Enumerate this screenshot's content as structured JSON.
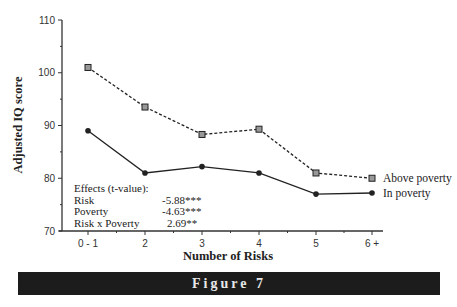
{
  "chart_data": {
    "type": "line",
    "title": "",
    "xlabel": "Number of Risks",
    "ylabel": "Adjusted IQ score",
    "categories": [
      "0 - 1",
      "2",
      "3",
      "4",
      "5",
      "6 +"
    ],
    "ylim": [
      70,
      110
    ],
    "yticks": [
      70,
      80,
      90,
      100,
      110
    ],
    "grid": false,
    "legend_position": "inline-right",
    "series": [
      {
        "name": "Above poverty",
        "style": "dashed",
        "marker": "square",
        "values": [
          101,
          93.5,
          88.3,
          89.3,
          81,
          80
        ]
      },
      {
        "name": "In poverty",
        "style": "solid",
        "marker": "circle",
        "values": [
          89,
          81,
          82.2,
          81,
          77,
          77.2
        ]
      }
    ],
    "annotations": {
      "title": "Effects (t-value):",
      "rows": [
        {
          "label": "Risk",
          "value": "-5.88***"
        },
        {
          "label": "Poverty",
          "value": "-4.63***"
        },
        {
          "label": "Risk x Poverty",
          "value": "2.69**"
        }
      ]
    }
  },
  "caption": "Figure 7"
}
